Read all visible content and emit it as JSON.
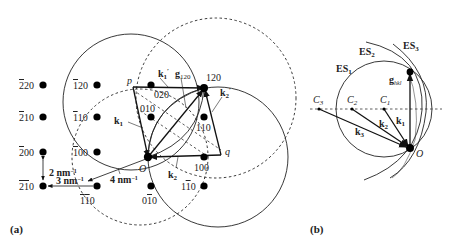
{
  "panel_a": {
    "label": "(a)",
    "spots": [
      {
        "id": "220bar",
        "text": "̅220",
        "display": "220",
        "bar": "2",
        "x": 43,
        "y": 85
      },
      {
        "id": "210bar",
        "display": "210",
        "bar": "2",
        "x": 43,
        "y": 117
      },
      {
        "id": "200bar",
        "display": "200",
        "bar": "2",
        "x": 43,
        "y": 152
      },
      {
        "id": "2bar1bar0",
        "display": "210",
        "bar": "2,1",
        "x": 43,
        "y": 186
      },
      {
        "id": "1bar20",
        "display": "120",
        "bar": "1",
        "x": 97,
        "y": 85
      },
      {
        "id": "1bar10",
        "display": "110",
        "bar": "1",
        "x": 97,
        "y": 117
      },
      {
        "id": "1bar00",
        "display": "100",
        "bar": "1",
        "x": 97,
        "y": 152
      },
      {
        "id": "1bar1bar0",
        "display": "110",
        "bar": "1,1",
        "x": 97,
        "y": 186
      },
      {
        "id": "020",
        "display": "020",
        "x": 151,
        "y": 85
      },
      {
        "id": "010",
        "display": "010",
        "x": 151,
        "y": 117
      },
      {
        "id": "0bar10",
        "display": "010",
        "bar": "1",
        "x": 151,
        "y": 186
      },
      {
        "id": "120",
        "display": "120",
        "x": 204,
        "y": 88
      },
      {
        "id": "110",
        "display": "110",
        "x": 204,
        "y": 117
      },
      {
        "id": "100",
        "display": "100",
        "x": 204,
        "y": 157
      },
      {
        "id": "11bar0",
        "display": "110",
        "bar": "1",
        "x": 204,
        "y": 186
      }
    ],
    "labels": {
      "origin": "O",
      "p": "p",
      "q": "q",
      "k1": "k",
      "k1_sub": "1",
      "k1_prime": "k",
      "k1_prime_sub": "1",
      "k2": "k",
      "k2_sub": "2",
      "k2_prime": "k",
      "k2_prime_sub": "2",
      "g120": "g",
      "g120_sub": "120",
      "scale_2": "2 nm",
      "scale_3": "3 nm",
      "scale_4": "4 nm",
      "scale_exp": "−1"
    }
  },
  "panel_b": {
    "label": "(b)",
    "labels": {
      "es1": "ES",
      "es1_sub": "1",
      "es2": "ES",
      "es2_sub": "2",
      "es3": "ES",
      "es3_sub": "3",
      "ghkl": "g",
      "ghkl_sub": "hkl",
      "c1": "C",
      "c1_sub": "1",
      "c2": "C",
      "c2_sub": "2",
      "c3": "C",
      "c3_sub": "3",
      "k1": "k",
      "k1_sub": "1",
      "k2": "k",
      "k2_sub": "2",
      "k3": "k",
      "k3_sub": "3",
      "origin": "O"
    }
  }
}
